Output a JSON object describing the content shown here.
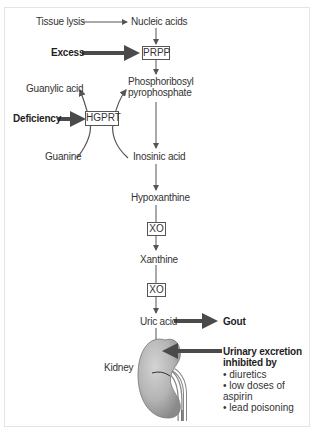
{
  "diagram": {
    "nodes": {
      "tissue_lysis": "Tissue lysis",
      "nucleic_acids": "Nucleic acids",
      "excess": "Excess",
      "prpp": "PRPP",
      "phosphoribosyl_line1": "Phosphoribosyl",
      "phosphoribosyl_line2": "pyrophosphate",
      "guanylic_acid": "Guanylic acid",
      "deficiency": "Deficiency",
      "hgprt": "HGPRT",
      "guanine": "Guanine",
      "inosinic_acid": "Inosinic acid",
      "hypoxanthine": "Hypoxanthine",
      "xo_1": "XO",
      "xanthine": "Xanthine",
      "xo_2": "XO",
      "uric_acid": "Uric acid",
      "gout": "Gout",
      "kidney": "Kidney"
    },
    "excretion": {
      "title_line1": "Urinary excretion",
      "title_line2": "inhibited by",
      "items": [
        "diuretics",
        "low doses of aspirin",
        "lead poisoning"
      ]
    },
    "colors": {
      "arrow": "#555555",
      "thick_arrow": "#4a4a4a",
      "kidney_fill": "#b8b8b8",
      "kidney_shadow": "#8c8c8c",
      "frame": "#e4e4e4"
    }
  }
}
